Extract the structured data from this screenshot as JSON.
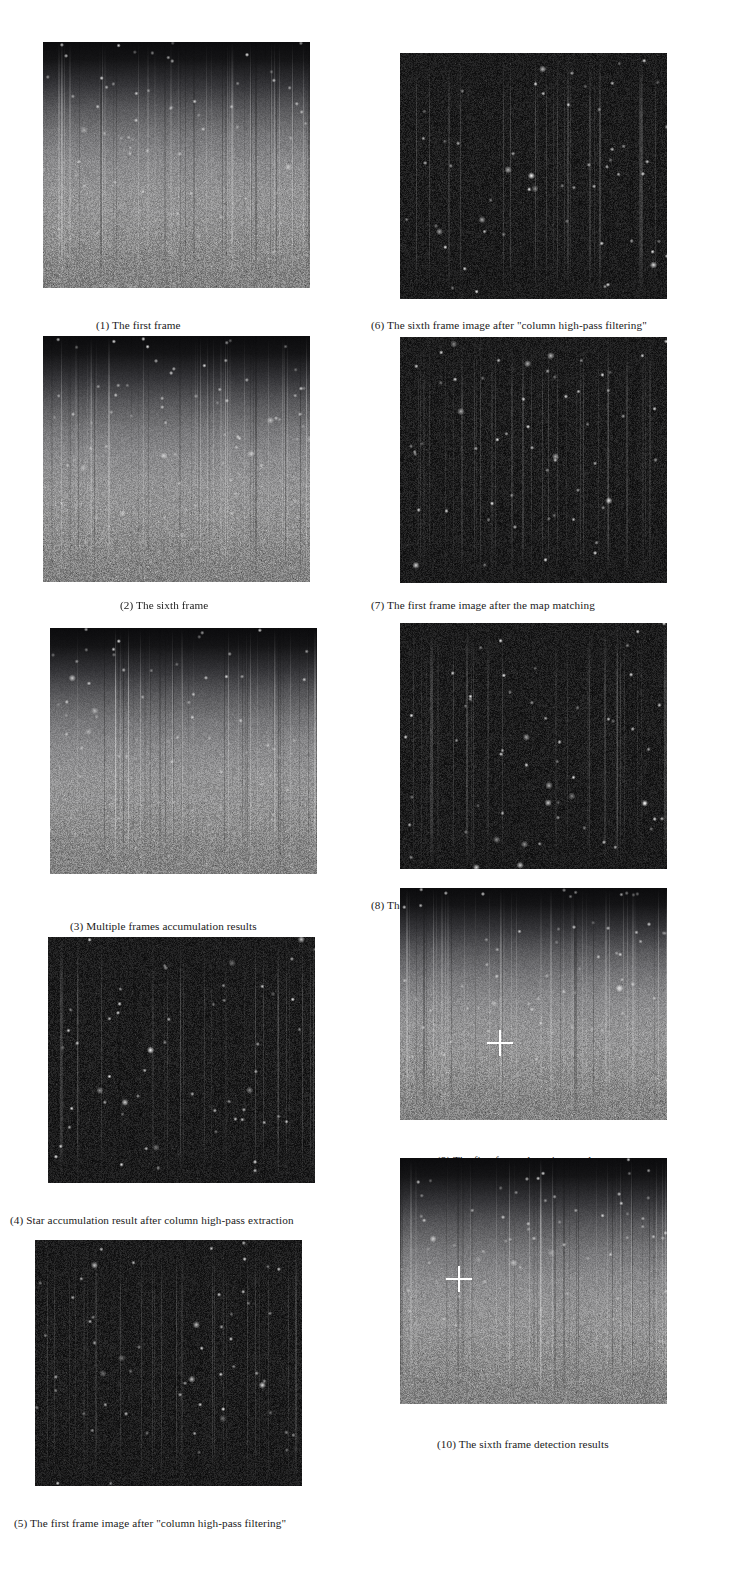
{
  "figure": {
    "layout": "two-column grayscale image panel figure",
    "panel_count": 10,
    "background_color": "#ffffff",
    "caption_color": "#1a1a1a",
    "marker_color": "#ffffff"
  },
  "panels": [
    {
      "id": "panel-1",
      "number": "(1)",
      "caption": "The first frame",
      "caption_full": "(1)    The first frame",
      "appearance": "gradient",
      "column": "left",
      "x": 43,
      "y": 42,
      "w": 267,
      "h": 246,
      "caption_x": 96,
      "caption_y": 318,
      "marker": null
    },
    {
      "id": "panel-2",
      "number": "(2)",
      "caption": "The sixth frame",
      "caption_full": "(2) The sixth frame",
      "appearance": "gradient",
      "column": "left",
      "x": 43,
      "y": 336,
      "w": 267,
      "h": 246,
      "caption_x": 120,
      "caption_y": 598,
      "marker": null
    },
    {
      "id": "panel-3",
      "number": "(3)",
      "caption": "Multiple frames accumulation results",
      "caption_full": "(3)  Multiple frames accumulation results",
      "appearance": "gradient",
      "column": "left",
      "x": 50,
      "y": 628,
      "w": 267,
      "h": 246,
      "caption_x": 70,
      "caption_y": 919,
      "marker": null
    },
    {
      "id": "panel-4",
      "number": "(4)",
      "caption": "Star accumulation result after column high-pass extraction",
      "caption_full": "(4) Star accumulation result after column high-pass extraction",
      "appearance": "darkfield",
      "column": "left",
      "x": 48,
      "y": 937,
      "w": 267,
      "h": 246,
      "caption_x": 10,
      "caption_y": 1213,
      "marker": null
    },
    {
      "id": "panel-5",
      "number": "(5)",
      "caption": "The first frame image after \"column high-pass filtering\"",
      "caption_full": "(5) The first frame image after \"column high-pass filtering\"",
      "appearance": "darkfield",
      "column": "left",
      "x": 35,
      "y": 1240,
      "w": 267,
      "h": 246,
      "caption_x": 14,
      "caption_y": 1516,
      "marker": null
    },
    {
      "id": "panel-6",
      "number": "(6)",
      "caption": "The sixth frame image after \"column high-pass filtering\"",
      "caption_full": "(6) The sixth frame image after \"column high-pass filtering\"",
      "appearance": "darkfield",
      "column": "right",
      "x": 400,
      "y": 53,
      "w": 267,
      "h": 246,
      "caption_x": 371,
      "caption_y": 318,
      "marker": null
    },
    {
      "id": "panel-7",
      "number": "(7)",
      "caption": "The first frame image after the map matching",
      "caption_full": "(7) The first frame image after the map matching",
      "appearance": "darkfield",
      "column": "right",
      "x": 400,
      "y": 337,
      "w": 267,
      "h": 246,
      "caption_x": 371,
      "caption_y": 598,
      "marker": null
    },
    {
      "id": "panel-8",
      "number": "(8)",
      "caption": "The sixth frame image after the map matching",
      "caption_full": "(8) The sixth frame image after the map matching",
      "appearance": "darkfield",
      "column": "right",
      "x": 400,
      "y": 623,
      "w": 267,
      "h": 246,
      "caption_x": 371,
      "caption_y": 898,
      "marker": null
    },
    {
      "id": "panel-9",
      "number": "(9)",
      "caption": "The first frame detection results",
      "caption_full": "(9) The first frame detection results",
      "appearance": "gradient",
      "column": "right",
      "x": 400,
      "y": 888,
      "w": 267,
      "h": 232,
      "caption_x": 437,
      "caption_y": 1153,
      "marker": {
        "type": "crosshair",
        "cx_pct": 37.5,
        "cy_pct": 67.0,
        "size": 26
      }
    },
    {
      "id": "panel-10",
      "number": "(10)",
      "caption": "The sixth frame detection results",
      "caption_full": "(10) The sixth frame detection results",
      "appearance": "gradient",
      "column": "right",
      "x": 400,
      "y": 1158,
      "w": 267,
      "h": 246,
      "caption_x": 437,
      "caption_y": 1437,
      "marker": {
        "type": "crosshair",
        "cx_pct": 22.0,
        "cy_pct": 49.0,
        "size": 26
      }
    }
  ]
}
